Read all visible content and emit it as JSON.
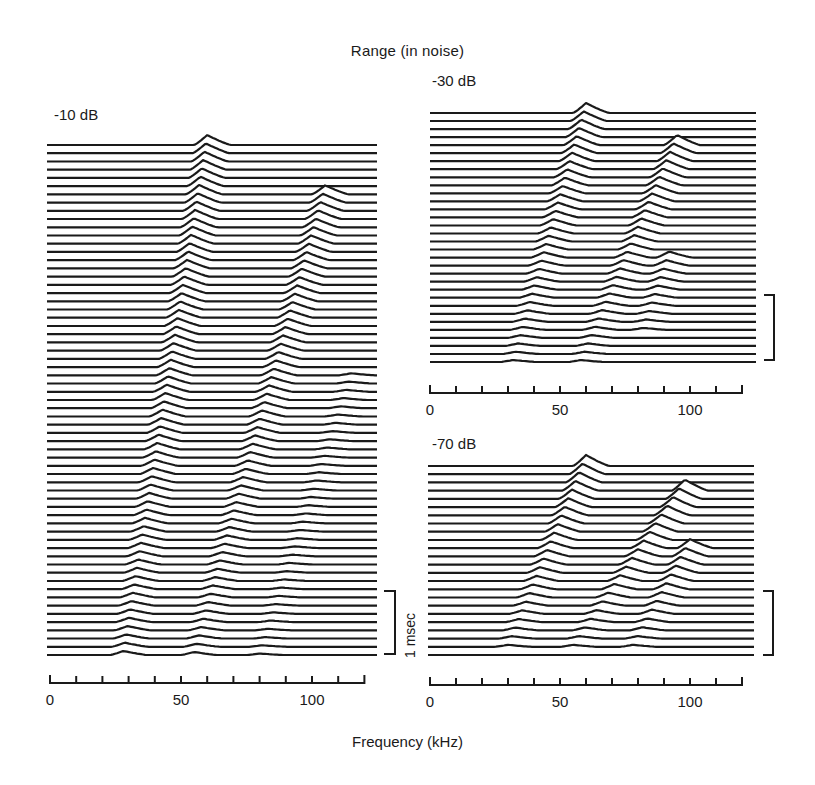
{
  "chart_data": {
    "type": "waterfall",
    "title": "Range (in noise)",
    "xlabel": "Frequency (kHz)",
    "ylabel": "Time (stacked spectra, 1 msec scale bar)",
    "time_scale_bar": "1 msec",
    "panels": [
      {
        "id": "p10",
        "label": "-10 dB",
        "xlim": [
          0,
          120
        ],
        "x_ticks": [
          0,
          10,
          20,
          30,
          40,
          50,
          60,
          70,
          80,
          90,
          100,
          110,
          120
        ],
        "x_tick_labels": [
          "0",
          "50",
          "100"
        ],
        "n_traces": 63,
        "ridges": [
          {
            "name": "harmonic 1 (FM sweep)",
            "freq_start_khz": 60,
            "freq_end_khz": 28,
            "peak_amp_start": 10,
            "peak_amp_end": 4,
            "start_trace": 0,
            "end_trace": 62
          },
          {
            "name": "harmonic 2 (FM sweep)",
            "freq_start_khz": 105,
            "freq_end_khz": 55,
            "peak_amp_start": 9,
            "peak_amp_end": 3,
            "start_trace": 6,
            "end_trace": 62
          },
          {
            "name": "harmonic 3 (weak)",
            "freq_start_khz": 115,
            "freq_end_khz": 80,
            "peak_amp_start": 2,
            "peak_amp_end": 1.5,
            "start_trace": 28,
            "end_trace": 62
          }
        ]
      },
      {
        "id": "p30",
        "label": "-30 dB",
        "xlim": [
          0,
          120
        ],
        "x_ticks": [
          0,
          10,
          20,
          30,
          40,
          50,
          60,
          70,
          80,
          90,
          100,
          110,
          120
        ],
        "x_tick_labels": [
          "0",
          "50",
          "100"
        ],
        "n_traces": 32,
        "ridges": [
          {
            "name": "harmonic 1 (FM sweep)",
            "freq_start_khz": 60,
            "freq_end_khz": 32,
            "peak_amp_start": 10,
            "peak_amp_end": 2,
            "start_trace": 0,
            "end_trace": 31
          },
          {
            "name": "harmonic 2 (FM sweep)",
            "freq_start_khz": 95,
            "freq_end_khz": 58,
            "peak_amp_start": 10,
            "peak_amp_end": 2,
            "start_trace": 4,
            "end_trace": 31
          },
          {
            "name": "harmonic 3 (weak)",
            "freq_start_khz": 92,
            "freq_end_khz": 82,
            "peak_amp_start": 6,
            "peak_amp_end": 2,
            "start_trace": 18,
            "end_trace": 27
          }
        ]
      },
      {
        "id": "p70",
        "label": "-70 dB",
        "xlim": [
          0,
          120
        ],
        "x_ticks": [
          0,
          10,
          20,
          30,
          40,
          50,
          60,
          70,
          80,
          90,
          100,
          110,
          120
        ],
        "x_tick_labels": [
          "0",
          "50",
          "100"
        ],
        "n_traces": 24,
        "ridges": [
          {
            "name": "harmonic 1 (FM sweep)",
            "freq_start_khz": 60,
            "freq_end_khz": 30,
            "peak_amp_start": 11,
            "peak_amp_end": 2,
            "start_trace": 0,
            "end_trace": 22
          },
          {
            "name": "harmonic 2 (FM sweep)",
            "freq_start_khz": 98,
            "freq_end_khz": 55,
            "peak_amp_start": 11,
            "peak_amp_end": 2,
            "start_trace": 3,
            "end_trace": 22
          },
          {
            "name": "harmonic 3 (FM sweep)",
            "freq_start_khz": 100,
            "freq_end_khz": 78,
            "peak_amp_start": 9,
            "peak_amp_end": 2,
            "start_trace": 10,
            "end_trace": 22
          }
        ]
      }
    ],
    "grid": false,
    "legend": null
  },
  "labels": {
    "title": "Range (in noise)",
    "xlabel": "Frequency (kHz)",
    "scale_bar": "1 msec",
    "panel_10": "-10 dB",
    "panel_30": "-30 dB",
    "panel_70": "-70 dB"
  },
  "ink_color": "#1a1a1a",
  "background": "#ffffff"
}
